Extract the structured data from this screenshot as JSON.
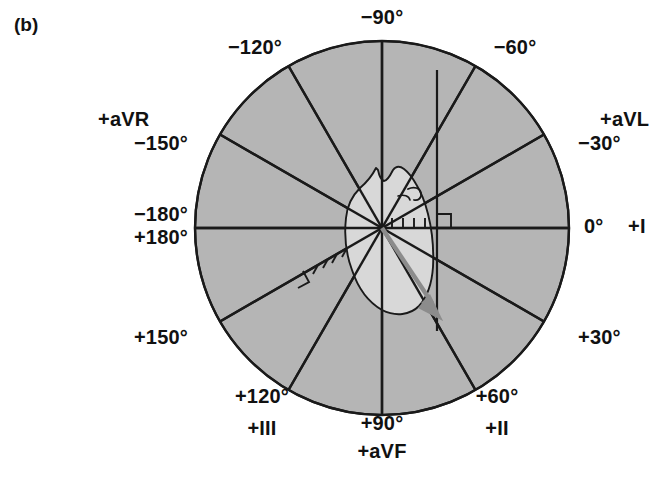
{
  "figure": {
    "panel_letter": "(b)",
    "background_color": "#ffffff",
    "disc_fill_color": "#b5b5b5",
    "disc_stroke_color": "#1a1a1a",
    "heart_fill_color": "#d8d8d8",
    "heart_stroke_color": "#1a1a1a",
    "axis_color": "#1a1a1a",
    "arrow_color": "#8c8c8c"
  },
  "geometry": {
    "center_x": 382,
    "center_y": 228,
    "radius": 187
  },
  "labels": [
    {
      "id": "neg-90",
      "angle_text": "−90°",
      "lead_text": "",
      "x": 382,
      "y": 16,
      "align": "center"
    },
    {
      "id": "neg-120",
      "angle_text": "−120°",
      "lead_text": "",
      "x": 255,
      "y": 46,
      "align": "center"
    },
    {
      "id": "neg-60",
      "angle_text": "−60°",
      "lead_text": "",
      "x": 511,
      "y": 46,
      "align": "center"
    },
    {
      "id": "avr",
      "angle_text": "",
      "lead_text": "+aVR",
      "x": 150,
      "y": 104,
      "align": "center"
    },
    {
      "id": "avl",
      "angle_text": "",
      "lead_text": "+aVL",
      "x": 630,
      "y": 104,
      "align": "right"
    },
    {
      "id": "neg-150",
      "angle_text": "−150°",
      "lead_text": "",
      "x": 185,
      "y": 130,
      "align": "right"
    },
    {
      "id": "neg-30",
      "angle_text": "−30°",
      "lead_text": "",
      "x": 580,
      "y": 130,
      "align": "left"
    },
    {
      "id": "neg-180",
      "angle_text": "−180°",
      "lead_text": "",
      "x": 185,
      "y": 208,
      "align": "right"
    },
    {
      "id": "pos-180",
      "angle_text": "+180°",
      "lead_text": "",
      "x": 185,
      "y": 232,
      "align": "right"
    },
    {
      "id": "zero-i",
      "angle_text": "0°",
      "lead_text": "+I",
      "x": 580,
      "y": 218,
      "align": "left"
    },
    {
      "id": "pos-150",
      "angle_text": "+150°",
      "lead_text": "",
      "x": 186,
      "y": 327,
      "align": "right"
    },
    {
      "id": "pos-30",
      "angle_text": "+30°",
      "lead_text": "",
      "x": 580,
      "y": 327,
      "align": "left"
    },
    {
      "id": "pos-120",
      "angle_text": "+120°",
      "lead_text": "+III",
      "x": 262,
      "y": 392,
      "align": "center"
    },
    {
      "id": "pos-60",
      "angle_text": "+60°",
      "lead_text": "+II",
      "x": 497,
      "y": 392,
      "align": "center"
    },
    {
      "id": "pos-90",
      "angle_text": "+90°",
      "lead_text": "+aVF",
      "x": 382,
      "y": 420,
      "align": "center"
    }
  ],
  "axes": [
    {
      "id": "axis-0-180",
      "angle_deg": 0,
      "label_pos": "0° / ±180°",
      "lead": "I"
    },
    {
      "id": "axis-30-150",
      "angle_deg": 30,
      "label_pos": "+30° / −150°",
      "lead": "aVR"
    },
    {
      "id": "axis-60-120",
      "angle_deg": 60,
      "label_pos": "+60° / −120°",
      "lead": "II"
    },
    {
      "id": "axis-90-270",
      "angle_deg": 90,
      "label_pos": "+90° / −90°",
      "lead": "aVF"
    },
    {
      "id": "axis-120-300",
      "angle_deg": 120,
      "label_pos": "+120° / −60°",
      "lead": "III"
    },
    {
      "id": "axis-150-330",
      "angle_deg": 150,
      "label_pos": "+150° / −30°",
      "lead": "aVL"
    }
  ],
  "mean_axis_vector": {
    "name": "mean QRS axis arrow",
    "angle_deg": 60,
    "origin_x": 382,
    "origin_y": 228,
    "tip_x": 441,
    "tip_y": 321,
    "color": "#8c8c8c"
  },
  "annotations": {
    "right_angle_markers": 2,
    "tick_marks_right": 4,
    "tick_marks_lower_left": 4,
    "vertical_construction_line": {
      "x": 437,
      "y_top": 70,
      "y_bottom": 331
    }
  }
}
